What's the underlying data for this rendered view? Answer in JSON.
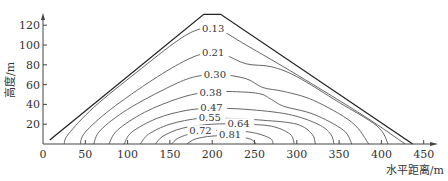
{
  "chart_data": {
    "type": "line",
    "title": "",
    "xlabel": "水平距离/m",
    "ylabel": "高度/m",
    "xlim": [
      0,
      460
    ],
    "ylim": [
      0,
      130
    ],
    "x_ticks": [
      0,
      50,
      100,
      150,
      200,
      250,
      300,
      350,
      400,
      450
    ],
    "y_ticks": [
      20,
      40,
      60,
      80,
      100,
      120
    ],
    "x_tick_labels": [
      "0",
      "50",
      "100",
      "150",
      "200",
      "250",
      "300",
      "350",
      "400",
      "450"
    ],
    "y_tick_labels": [
      "20",
      "40",
      "60",
      "80",
      "100",
      "120"
    ],
    "grid": false,
    "boundary": {
      "name": "dam-profile",
      "points": [
        [
          8,
          4
        ],
        [
          190,
          131
        ],
        [
          210,
          131
        ],
        [
          437,
          0
        ]
      ]
    },
    "series": [
      {
        "name": "0.13",
        "label_at": [
          188,
          116
        ],
        "points": [
          [
            25,
            0
          ],
          [
            30,
            10
          ],
          [
            60,
            37
          ],
          [
            110,
            72
          ],
          [
            160,
            105
          ],
          [
            185,
            116
          ],
          [
            205,
            117
          ],
          [
            240,
            100
          ],
          [
            300,
            70
          ],
          [
            380,
            28
          ],
          [
            428,
            0
          ]
        ]
      },
      {
        "name": "0.21",
        "label_at": [
          188,
          92
        ],
        "points": [
          [
            44,
            0
          ],
          [
            50,
            12
          ],
          [
            80,
            35
          ],
          [
            130,
            65
          ],
          [
            170,
            85
          ],
          [
            195,
            92
          ],
          [
            215,
            90
          ],
          [
            240,
            81
          ],
          [
            270,
            78
          ],
          [
            300,
            68
          ],
          [
            350,
            42
          ],
          [
            395,
            18
          ],
          [
            408,
            0
          ]
        ]
      },
      {
        "name": "0.30",
        "label_at": [
          190,
          70
        ],
        "points": [
          [
            60,
            0
          ],
          [
            68,
            14
          ],
          [
            100,
            35
          ],
          [
            150,
            58
          ],
          [
            180,
            68
          ],
          [
            210,
            70
          ],
          [
            240,
            66
          ],
          [
            260,
            57
          ],
          [
            285,
            53
          ],
          [
            320,
            44
          ],
          [
            365,
            22
          ],
          [
            385,
            0
          ]
        ]
      },
      {
        "name": "0.38",
        "label_at": [
          185,
          52
        ],
        "points": [
          [
            78,
            0
          ],
          [
            88,
            14
          ],
          [
            120,
            32
          ],
          [
            160,
            46
          ],
          [
            190,
            52
          ],
          [
            220,
            53
          ],
          [
            255,
            51
          ],
          [
            270,
            45
          ],
          [
            285,
            38
          ],
          [
            320,
            30
          ],
          [
            355,
            14
          ],
          [
            365,
            0
          ]
        ]
      },
      {
        "name": "0.47",
        "label_at": [
          186,
          36
        ],
        "points": [
          [
            96,
            0
          ],
          [
            105,
            12
          ],
          [
            135,
            26
          ],
          [
            170,
            34
          ],
          [
            200,
            36
          ],
          [
            240,
            35
          ],
          [
            290,
            30
          ],
          [
            325,
            20
          ],
          [
            340,
            10
          ],
          [
            344,
            0
          ]
        ]
      },
      {
        "name": "0.55",
        "label_at": [
          184,
          26
        ],
        "points": [
          [
            115,
            0
          ],
          [
            125,
            10
          ],
          [
            150,
            20
          ],
          [
            185,
            26
          ],
          [
            215,
            26
          ],
          [
            260,
            24
          ],
          [
            300,
            20
          ],
          [
            318,
            10
          ],
          [
            322,
            0
          ]
        ]
      },
      {
        "name": "0.64",
        "label_at": [
          218,
          20
        ],
        "points": [
          [
            133,
            0
          ],
          [
            142,
            8
          ],
          [
            165,
            16
          ],
          [
            200,
            20
          ],
          [
            235,
            20
          ],
          [
            270,
            18
          ],
          [
            292,
            10
          ],
          [
            297,
            0
          ]
        ]
      },
      {
        "name": "0.72",
        "label_at": [
          173,
          13
        ],
        "points": [
          [
            152,
            0
          ],
          [
            160,
            6
          ],
          [
            178,
            11
          ],
          [
            210,
            14
          ],
          [
            245,
            12
          ],
          [
            268,
            6
          ],
          [
            272,
            0
          ]
        ]
      },
      {
        "name": "0.81",
        "label_at": [
          208,
          9
        ],
        "points": [
          [
            170,
            0
          ],
          [
            180,
            5
          ],
          [
            200,
            8
          ],
          [
            225,
            8
          ],
          [
            245,
            5
          ],
          [
            252,
            0
          ]
        ]
      }
    ]
  }
}
